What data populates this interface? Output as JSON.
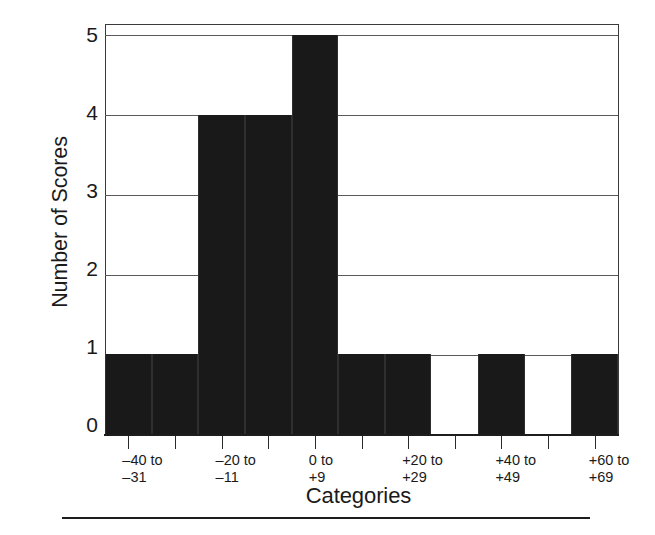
{
  "chart_data": {
    "type": "bar",
    "title": "",
    "xlabel": "Categories",
    "ylabel": "Number of Scores",
    "categories": [
      "-40 to\n-31",
      "",
      "-20 to\n-11",
      "",
      "0 to\n+9",
      "",
      "+20 to\n+29",
      "",
      "+40 to\n+49",
      "",
      "+60 to\n+69"
    ],
    "values": [
      1,
      1,
      4,
      4,
      5,
      1,
      1,
      0,
      1,
      0,
      1
    ],
    "ylim": [
      0,
      5
    ],
    "yticks": [
      0,
      1,
      2,
      3,
      4,
      5
    ],
    "grid": true,
    "legend_position": "none",
    "bar_color": "#191919",
    "bin_labels": [
      {
        "index": 0,
        "line1": "–40 to",
        "line2": "–31"
      },
      {
        "index": 2,
        "line1": "–20 to",
        "line2": "–11"
      },
      {
        "index": 4,
        "line1": "0 to",
        "line2": "+9"
      },
      {
        "index": 6,
        "line1": "+20 to",
        "line2": "+29"
      },
      {
        "index": 8,
        "line1": "+40 to",
        "line2": "+49"
      },
      {
        "index": 10,
        "line1": "+60 to",
        "line2": "+69"
      }
    ]
  },
  "axis": {
    "ylabel": "Number of Scores",
    "xlabel": "Categories",
    "yticks": [
      {
        "value": 5,
        "label": "5"
      },
      {
        "value": 4,
        "label": "4"
      },
      {
        "value": 3,
        "label": "3"
      },
      {
        "value": 2,
        "label": "2"
      },
      {
        "value": 1,
        "label": "1"
      },
      {
        "value": 0,
        "label": "0"
      }
    ]
  },
  "bin_labels": [
    {
      "line1": "–40 to",
      "line2": "–31"
    },
    {
      "line1": "–20 to",
      "line2": "–11"
    },
    {
      "line1": "0 to",
      "line2": "+9"
    },
    {
      "line1": "+20 to",
      "line2": "+29"
    },
    {
      "line1": "+40 to",
      "line2": "+49"
    },
    {
      "line1": "+60 to",
      "line2": "+69"
    }
  ],
  "style": {
    "bar_color": "#191919",
    "grid_color": "#5a5a5a",
    "frame_color": "#3a3a3a",
    "text_color": "#1a1a1a",
    "background": "#ffffff"
  }
}
